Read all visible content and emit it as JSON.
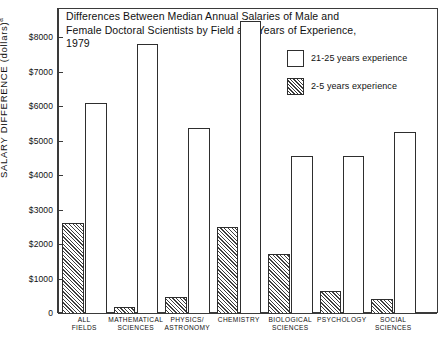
{
  "chart_data": {
    "type": "bar",
    "title": "Differences Between Median Annual Salaries of Male and Female Doctoral Scientists by Field and Years of Experience, 1979",
    "title_lines": [
      "Differences Between Median Annual Salaries of Male and",
      "Female Doctoral Scientists by Field and Years of Experience, 1979"
    ],
    "xlabel": "",
    "ylabel": "SALARY DIFFERENCE (dollars)",
    "ylabel_superscript": "a",
    "ylim": [
      0,
      8800
    ],
    "ytick_values": [
      0,
      1000,
      2000,
      3000,
      4000,
      5000,
      6000,
      7000,
      8000
    ],
    "ytick_labels": [
      "0",
      "$1000",
      "$2000",
      "$3000",
      "$4000",
      "$5000",
      "$6000",
      "$7000",
      "$8000"
    ],
    "grid": false,
    "legend_position": "top-right",
    "categories": [
      "ALL FIELDS",
      "MATHEMATICAL SCIENCES",
      "PHYSICS/ ASTRONOMY",
      "CHEMISTRY",
      "BIOLOGICAL SCIENCES",
      "PSYCHOLOGY",
      "SOCIAL SCIENCES"
    ],
    "category_label_lines": [
      [
        "ALL",
        "FIELDS"
      ],
      [
        "MATHEMATICAL",
        "SCIENCES"
      ],
      [
        "PHYSICS/",
        "ASTRONOMY"
      ],
      [
        "CHEMISTRY"
      ],
      [
        "BIOLOGICAL",
        "SCIENCES"
      ],
      [
        "PSYCHOLOGY"
      ],
      [
        "SOCIAL",
        "SCIENCES"
      ]
    ],
    "series": [
      {
        "name": "2-5 years experience",
        "style": "hatched",
        "values": [
          2600,
          180,
          470,
          2500,
          1700,
          650,
          420
        ]
      },
      {
        "name": "21-25 years experience",
        "style": "open",
        "values": [
          6100,
          7800,
          5350,
          8450,
          4550,
          4550,
          5250
        ]
      }
    ]
  },
  "legend": {
    "items": [
      {
        "label": "21-25 years experience",
        "style": "open"
      },
      {
        "label": "2-5 years experience",
        "style": "hatched"
      }
    ]
  },
  "colors": {
    "background": "#ffffff",
    "ink": "#2e2e2e",
    "text": "#111111"
  }
}
